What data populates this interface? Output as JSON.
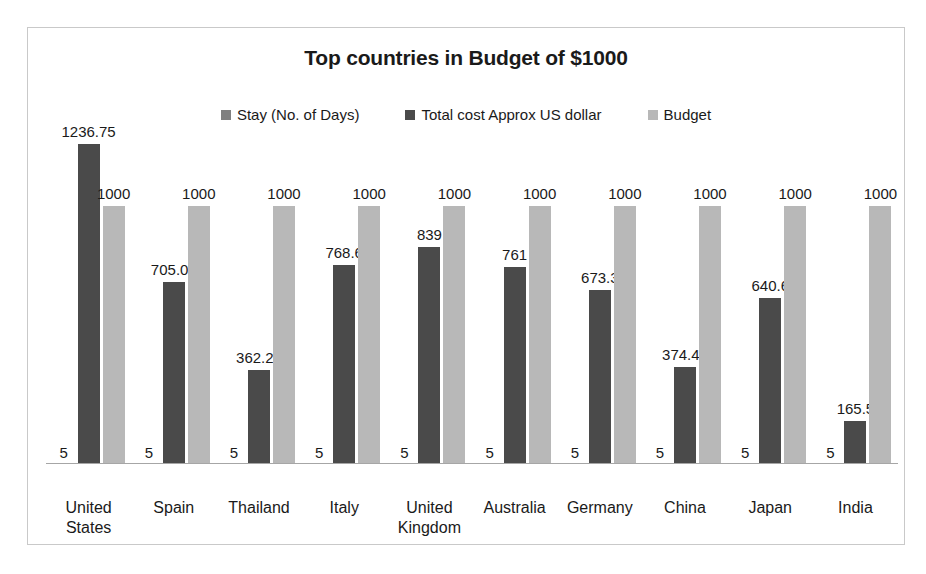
{
  "chart_data": {
    "type": "bar",
    "title": "Top countries in Budget of $1000",
    "xlabel": "",
    "ylabel": "",
    "ylim": [
      0,
      1300
    ],
    "grid": false,
    "legend_position": "top-center",
    "categories": [
      "United States",
      "Spain",
      "Thailand",
      "Italy",
      "United Kingdom",
      "Australia",
      "Germany",
      "China",
      "Japan",
      "India"
    ],
    "category_lines": [
      [
        "United",
        "States"
      ],
      [
        "Spain"
      ],
      [
        "Thailand"
      ],
      [
        "Italy"
      ],
      [
        "United",
        "Kingdom"
      ],
      [
        "Australia"
      ],
      [
        "Germany"
      ],
      [
        "China"
      ],
      [
        "Japan"
      ],
      [
        "India"
      ]
    ],
    "series": [
      {
        "name": "Stay (No. of Days)",
        "color": "#808080",
        "values": [
          5,
          5,
          5,
          5,
          5,
          5,
          5,
          5,
          5,
          5
        ],
        "labels": [
          "5",
          "5",
          "5",
          "5",
          "5",
          "5",
          "5",
          "5",
          "5",
          "5"
        ]
      },
      {
        "name": "Total cost Approx US dollar",
        "color": "#4a4a4a",
        "values": [
          1236.75,
          705.05,
          362.25,
          768.6,
          839,
          761,
          673.3,
          374.45,
          640.6,
          165.5
        ],
        "labels": [
          "1236.75",
          "705.05",
          "362.25",
          "768.6",
          "839",
          "761",
          "673.3",
          "374.45",
          "640.6",
          "165.5"
        ]
      },
      {
        "name": "Budget",
        "color": "#b8b8b8",
        "values": [
          1000,
          1000,
          1000,
          1000,
          1000,
          1000,
          1000,
          1000,
          1000,
          1000
        ],
        "labels": [
          "1000",
          "1000",
          "1000",
          "1000",
          "1000",
          "1000",
          "1000",
          "1000",
          "1000",
          "1000"
        ]
      }
    ]
  },
  "legend": {
    "items": [
      {
        "label": "Stay (No. of Days)",
        "color": "#808080"
      },
      {
        "label": "Total cost Approx US dollar",
        "color": "#4a4a4a"
      },
      {
        "label": "Budget",
        "color": "#b8b8b8"
      }
    ]
  }
}
